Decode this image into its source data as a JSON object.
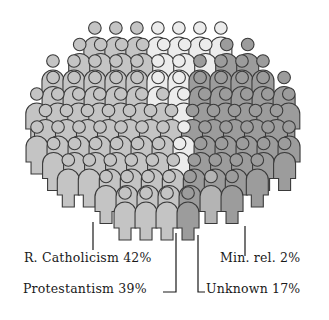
{
  "chart_data": {
    "type": "pie",
    "style": "pictogram-oval-crowd",
    "title": "",
    "categories": [
      "R. Catholicism",
      "Protestantism",
      "Unknown",
      "Min. rel."
    ],
    "values": [
      42,
      39,
      17,
      2
    ],
    "unit": "%",
    "colors": {
      "R. Catholicism": "#c4c4c4",
      "Protestantism": "#ececec",
      "Unknown": "#9c9c9c",
      "Min. rel.": "#b4b4b4"
    },
    "legend_position": "bottom, leader-line labels"
  },
  "labels": [
    {
      "key": "catholic",
      "text": "R. Catholicism 42%"
    },
    {
      "key": "protestant",
      "text": "Protestantism 39%"
    },
    {
      "key": "minrel",
      "text": "Min. rel. 2%"
    },
    {
      "key": "unknown",
      "text": "Unknown 17%"
    }
  ],
  "style": {
    "outline": "#3a3a3a",
    "catholic": "#c4c4c4",
    "protestant": "#ececec",
    "unknown": "#9c9c9c",
    "minrel": "#b4b4b4"
  }
}
